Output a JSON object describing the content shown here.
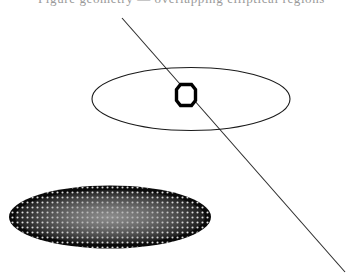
{
  "canvas": {
    "width": 363,
    "height": 275,
    "background_color": "#ffffff"
  },
  "caption": {
    "text": "Figure geometry — overlapping elliptical regions",
    "note": "cut off at top edge of image, only glyph descenders visible",
    "color": "#9a9a9a"
  },
  "shapes": {
    "diagonal_line": {
      "label": "diagonal line",
      "x1": 122,
      "y1": 18,
      "x2": 345,
      "y2": 272,
      "stroke_color": "#2b2b2b",
      "stroke_width": 1.1
    },
    "outline_ellipse": {
      "label": "outlined ellipse",
      "cx": 191,
      "cy": 99,
      "rx": 99,
      "ry": 31.5,
      "stroke_color": "#1a1a1a",
      "stroke_width": 1.1,
      "fill": "none"
    },
    "octagon_marker": {
      "label": "octagon marker",
      "cx": 186,
      "cy": 95,
      "width": 19,
      "height": 21,
      "stroke_color": "#000000",
      "stroke_width": 3.4,
      "fill": "#ffffff"
    },
    "filled_ellipse": {
      "label": "halftone filled ellipse",
      "cx": 110,
      "cy": 217,
      "rx": 101,
      "ry": 31.5,
      "fill_color": "#0a0a0a",
      "highlight_color": "#8c8c8c",
      "dot_color": "#ffffff",
      "dot_spacing": 5,
      "dot_radius": 1.05
    }
  }
}
